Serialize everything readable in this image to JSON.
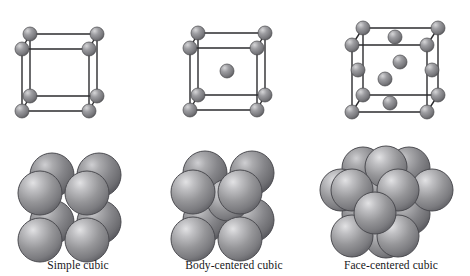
{
  "figure": {
    "background_color": "#ffffff",
    "sphere_color": "#8b8b8e",
    "sphere_highlight": "#dcdcde",
    "sphere_shadow": "#4e4e52",
    "edge_color": "#2b2b2e",
    "caption_color": "#17171a"
  },
  "cells": [
    {
      "id": "simple-cubic",
      "caption": "Simple cubic",
      "lattice_points": 8,
      "description": "corner atoms only",
      "wireframe": {
        "corners": [
          {
            "name": "back-top-left",
            "x": 30,
            "y": 34
          },
          {
            "name": "back-top-right",
            "x": 97,
            "y": 34
          },
          {
            "name": "front-top-left",
            "x": 22,
            "y": 49
          },
          {
            "name": "front-top-right",
            "x": 89,
            "y": 49
          },
          {
            "name": "back-bottom-left",
            "x": 30,
            "y": 96
          },
          {
            "name": "back-bottom-right",
            "x": 97,
            "y": 96
          },
          {
            "name": "front-bottom-left",
            "x": 22,
            "y": 111
          },
          {
            "name": "front-bottom-right",
            "x": 89,
            "y": 111
          }
        ],
        "interior": [],
        "radius": 7
      },
      "packing": {
        "center_x": 75,
        "spheres": [
          {
            "x": 52,
            "y": 175,
            "r": 22,
            "layer": "back"
          },
          {
            "x": 99,
            "y": 175,
            "r": 22,
            "layer": "back"
          },
          {
            "x": 52,
            "y": 222,
            "r": 22,
            "layer": "back"
          },
          {
            "x": 99,
            "y": 222,
            "r": 22,
            "layer": "back"
          },
          {
            "x": 40,
            "y": 193,
            "r": 22,
            "layer": "front"
          },
          {
            "x": 87,
            "y": 193,
            "r": 22,
            "layer": "front"
          },
          {
            "x": 40,
            "y": 240,
            "r": 22,
            "layer": "front"
          },
          {
            "x": 87,
            "y": 240,
            "r": 22,
            "layer": "front"
          }
        ]
      }
    },
    {
      "id": "body-centered-cubic",
      "caption": "Body-centered cubic",
      "lattice_points": 9,
      "description": "corner atoms plus one atom at the body center",
      "wireframe": {
        "corners": [
          {
            "name": "back-top-left",
            "x": 198,
            "y": 33
          },
          {
            "name": "back-top-right",
            "x": 265,
            "y": 33
          },
          {
            "name": "front-top-left",
            "x": 190,
            "y": 48
          },
          {
            "name": "front-top-right",
            "x": 257,
            "y": 48
          },
          {
            "name": "back-bottom-left",
            "x": 198,
            "y": 95
          },
          {
            "name": "back-bottom-right",
            "x": 265,
            "y": 95
          },
          {
            "name": "front-bottom-left",
            "x": 190,
            "y": 110
          },
          {
            "name": "front-bottom-right",
            "x": 257,
            "y": 110
          }
        ],
        "interior": [
          {
            "name": "body-center",
            "x": 227,
            "y": 71
          }
        ],
        "radius": 7
      },
      "packing": {
        "center_x": 228,
        "spheres": [
          {
            "x": 205,
            "y": 173,
            "r": 22,
            "layer": "back"
          },
          {
            "x": 252,
            "y": 173,
            "r": 22,
            "layer": "back"
          },
          {
            "x": 205,
            "y": 220,
            "r": 22,
            "layer": "back"
          },
          {
            "x": 252,
            "y": 220,
            "r": 22,
            "layer": "back"
          },
          {
            "x": 228,
            "y": 200,
            "r": 21,
            "layer": "center"
          },
          {
            "x": 193,
            "y": 192,
            "r": 22,
            "layer": "front"
          },
          {
            "x": 240,
            "y": 192,
            "r": 22,
            "layer": "front"
          },
          {
            "x": 193,
            "y": 239,
            "r": 22,
            "layer": "front"
          },
          {
            "x": 240,
            "y": 239,
            "r": 22,
            "layer": "front"
          }
        ]
      }
    },
    {
      "id": "face-centered-cubic",
      "caption": "Face-centered cubic",
      "lattice_points": 14,
      "description": "corner atoms plus one atom at the center of each of the six faces",
      "wireframe": {
        "corners": [
          {
            "name": "back-top-left",
            "x": 363,
            "y": 28
          },
          {
            "name": "back-top-right",
            "x": 438,
            "y": 28
          },
          {
            "name": "front-top-left",
            "x": 352,
            "y": 45
          },
          {
            "name": "front-top-right",
            "x": 427,
            "y": 45
          },
          {
            "name": "back-bottom-left",
            "x": 363,
            "y": 95
          },
          {
            "name": "back-bottom-right",
            "x": 438,
            "y": 95
          },
          {
            "name": "front-bottom-left",
            "x": 352,
            "y": 112
          },
          {
            "name": "front-bottom-right",
            "x": 427,
            "y": 112
          }
        ],
        "interior": [
          {
            "name": "top-face-center",
            "x": 395,
            "y": 37
          },
          {
            "name": "back-face-center",
            "x": 400,
            "y": 62
          },
          {
            "name": "left-face-center",
            "x": 358,
            "y": 70
          },
          {
            "name": "right-face-center",
            "x": 432,
            "y": 70
          },
          {
            "name": "front-face-center",
            "x": 385,
            "y": 79
          },
          {
            "name": "bottom-face-center",
            "x": 390,
            "y": 103
          }
        ],
        "radius": 7
      },
      "packing": {
        "center_x": 390,
        "spheres": [
          {
            "x": 363,
            "y": 168,
            "r": 21,
            "layer": "back"
          },
          {
            "x": 409,
            "y": 168,
            "r": 21,
            "layer": "back"
          },
          {
            "x": 363,
            "y": 214,
            "r": 21,
            "layer": "back"
          },
          {
            "x": 409,
            "y": 214,
            "r": 21,
            "layer": "back"
          },
          {
            "x": 386,
            "y": 191,
            "r": 21,
            "layer": "back-face"
          },
          {
            "x": 341,
            "y": 190,
            "r": 21,
            "layer": "mid"
          },
          {
            "x": 432,
            "y": 190,
            "r": 21,
            "layer": "mid"
          },
          {
            "x": 386,
            "y": 167,
            "r": 21,
            "layer": "mid"
          },
          {
            "x": 386,
            "y": 237,
            "r": 21,
            "layer": "mid"
          },
          {
            "x": 352,
            "y": 190,
            "r": 21,
            "layer": "front"
          },
          {
            "x": 398,
            "y": 190,
            "r": 21,
            "layer": "front"
          },
          {
            "x": 352,
            "y": 236,
            "r": 21,
            "layer": "front"
          },
          {
            "x": 398,
            "y": 236,
            "r": 21,
            "layer": "front"
          },
          {
            "x": 375,
            "y": 213,
            "r": 21,
            "layer": "front-face"
          }
        ]
      }
    }
  ]
}
